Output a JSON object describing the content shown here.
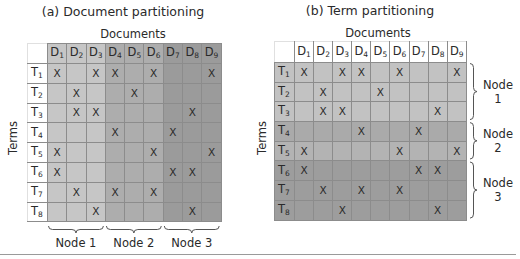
{
  "panel_a": {
    "title": "(a) Document partitioning",
    "x_axis_label": "Documents",
    "y_axis_label": "Terms",
    "nodes": [
      "Node 1",
      "Node 2",
      "Node 3"
    ],
    "node_columns": [
      [
        "D1",
        "D2",
        "D3"
      ],
      [
        "D4",
        "D5",
        "D6"
      ],
      [
        "D7",
        "D8",
        "D9"
      ]
    ],
    "partition_axis": "columns",
    "group_colors": [
      "#c6c6c6",
      "#adadad",
      "#9b9b9b"
    ]
  },
  "panel_b": {
    "title": "(b) Term partitioning",
    "x_axis_label": "Documents",
    "y_axis_label": "Terms",
    "nodes": [
      {
        "line1": "Node",
        "line2": "1"
      },
      {
        "line1": "Node",
        "line2": "2"
      },
      {
        "line1": "Node",
        "line2": "3"
      }
    ],
    "node_rows": [
      [
        "T1",
        "T2",
        "T3"
      ],
      [
        "T4",
        "T5"
      ],
      [
        "T6",
        "T7",
        "T8"
      ]
    ],
    "partition_axis": "rows",
    "group_colors": [
      "#c2c2c2",
      "#aaaaaa",
      "#9d9d9d"
    ]
  },
  "matrix": {
    "documents": [
      {
        "base": "D",
        "sub": "1"
      },
      {
        "base": "D",
        "sub": "2"
      },
      {
        "base": "D",
        "sub": "3"
      },
      {
        "base": "D",
        "sub": "4"
      },
      {
        "base": "D",
        "sub": "5"
      },
      {
        "base": "D",
        "sub": "6"
      },
      {
        "base": "D",
        "sub": "7"
      },
      {
        "base": "D",
        "sub": "8"
      },
      {
        "base": "D",
        "sub": "9"
      }
    ],
    "terms": [
      {
        "base": "T",
        "sub": "1"
      },
      {
        "base": "T",
        "sub": "2"
      },
      {
        "base": "T",
        "sub": "3"
      },
      {
        "base": "T",
        "sub": "4"
      },
      {
        "base": "T",
        "sub": "5"
      },
      {
        "base": "T",
        "sub": "6"
      },
      {
        "base": "T",
        "sub": "7"
      },
      {
        "base": "T",
        "sub": "8"
      }
    ],
    "mark_symbol": "X",
    "occurrences": [
      [
        1,
        0,
        1,
        1,
        0,
        1,
        0,
        0,
        1
      ],
      [
        0,
        1,
        0,
        0,
        1,
        0,
        0,
        0,
        0
      ],
      [
        0,
        1,
        1,
        0,
        0,
        0,
        0,
        1,
        0
      ],
      [
        0,
        0,
        0,
        1,
        0,
        0,
        1,
        0,
        0
      ],
      [
        1,
        0,
        0,
        0,
        0,
        1,
        0,
        0,
        1
      ],
      [
        1,
        0,
        0,
        0,
        0,
        0,
        1,
        1,
        0
      ],
      [
        0,
        1,
        0,
        1,
        0,
        1,
        0,
        0,
        0
      ],
      [
        0,
        0,
        1,
        0,
        0,
        0,
        0,
        1,
        0
      ]
    ]
  }
}
